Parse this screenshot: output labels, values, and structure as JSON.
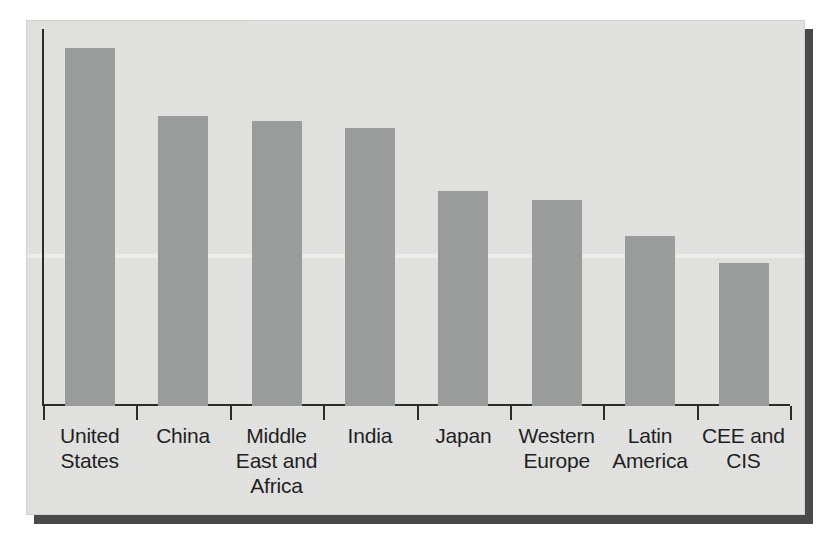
{
  "figure": {
    "kind": "scanned-bar-chart-figure",
    "panel_background": "#e4e4e3",
    "bar_color": "#9b9c9c",
    "axis_color": "#2b2b2b",
    "shadow_color": "#4a4a4a"
  },
  "chart_data": {
    "type": "bar",
    "title": "",
    "subtitle": "",
    "xlabel": "",
    "ylabel": "",
    "grid": false,
    "legend": null,
    "ylim": [
      0,
      100
    ],
    "y_axis_ticks_visible": false,
    "x_axis_ticks_visible": true,
    "categories": [
      "United States",
      "China",
      "Middle East and Africa",
      "India",
      "Japan",
      "Western Europe",
      "Latin America",
      "CEE and CIS"
    ],
    "category_label_lines": [
      [
        "United",
        "States"
      ],
      [
        "China"
      ],
      [
        "Middle",
        "East and",
        "Africa"
      ],
      [
        "India"
      ],
      [
        "Japan"
      ],
      [
        "Western",
        "Europe"
      ],
      [
        "Latin",
        "America"
      ],
      [
        "CEE and",
        "CIS"
      ]
    ],
    "values": [
      100,
      81,
      79.6,
      77.7,
      60,
      57.5,
      47.5,
      40
    ],
    "series": [
      {
        "name": "",
        "values": [
          100,
          81,
          79.6,
          77.7,
          60,
          57.5,
          47.5,
          40
        ]
      }
    ],
    "bar_pixel_heights": [
      358,
      290,
      285,
      278,
      215,
      206,
      170,
      143
    ],
    "bar_pixel_width": 50,
    "category_pixel_width": 93.4
  }
}
